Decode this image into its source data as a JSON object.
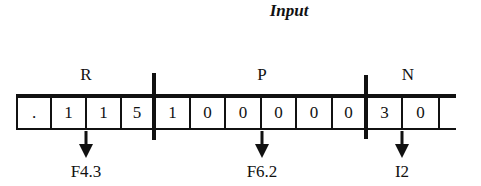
{
  "title": "Input",
  "groups": [
    {
      "label": "R",
      "center_x": 86
    },
    {
      "label": "P",
      "center_x": 262
    },
    {
      "label": "N",
      "center_x": 408
    }
  ],
  "cells": [
    ".",
    "1",
    "1",
    "5",
    "1",
    "0",
    "0",
    "0",
    "0",
    "0",
    "3",
    "0",
    ""
  ],
  "formats": [
    {
      "label": "F4.3",
      "x": 86
    },
    {
      "label": "F6.2",
      "x": 262
    },
    {
      "label": "I2",
      "x": 402
    }
  ]
}
